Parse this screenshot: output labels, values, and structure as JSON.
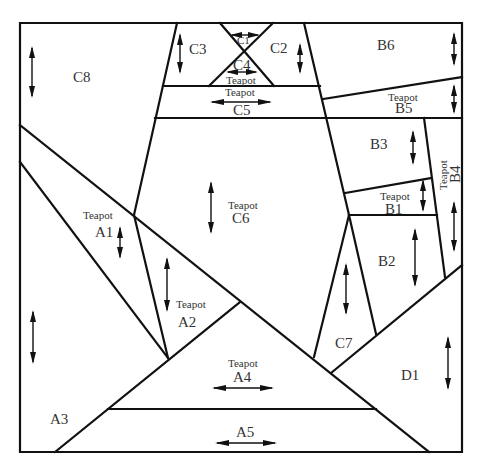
{
  "diagram": {
    "type": "cutting-layout",
    "panel_count": 21,
    "border": {
      "x": 20,
      "y": 23,
      "width": 201,
      "height": 199
    },
    "pieces": [
      {
        "id": "C8",
        "label": "C8",
        "teapot": false,
        "grain": "vertical"
      },
      {
        "id": "C3",
        "label": "C3",
        "teapot": false,
        "grain": "vertical"
      },
      {
        "id": "C1",
        "label": "C1",
        "teapot": false,
        "grain": "horizontal"
      },
      {
        "id": "C2",
        "label": "C2",
        "teapot": false,
        "grain": "vertical"
      },
      {
        "id": "C4",
        "label": "C4",
        "teapot": true,
        "grain": "horizontal"
      },
      {
        "id": "C5",
        "label": "C5",
        "teapot": true,
        "grain": "horizontal"
      },
      {
        "id": "C6",
        "label": "C6",
        "teapot": true,
        "grain": "vertical"
      },
      {
        "id": "C7",
        "label": "C7",
        "teapot": false,
        "grain": "vertical"
      },
      {
        "id": "B6",
        "label": "B6",
        "teapot": false,
        "grain": "vertical"
      },
      {
        "id": "B5",
        "label": "B5",
        "teapot": true,
        "grain": "vertical"
      },
      {
        "id": "B3",
        "label": "B3",
        "teapot": false,
        "grain": "vertical"
      },
      {
        "id": "B4",
        "label": "B4",
        "teapot": true,
        "grain": "vertical"
      },
      {
        "id": "B1",
        "label": "B1",
        "teapot": true,
        "grain": "vertical"
      },
      {
        "id": "B2",
        "label": "B2",
        "teapot": false,
        "grain": "vertical"
      },
      {
        "id": "A1",
        "label": "A1",
        "teapot": true,
        "grain": "vertical"
      },
      {
        "id": "A2",
        "label": "A2",
        "teapot": true,
        "grain": "vertical"
      },
      {
        "id": "A3",
        "label": "A3",
        "teapot": false,
        "grain": "vertical"
      },
      {
        "id": "A4",
        "label": "A4",
        "teapot": true,
        "grain": "horizontal"
      },
      {
        "id": "A5",
        "label": "A5",
        "teapot": false,
        "grain": "horizontal"
      },
      {
        "id": "D1",
        "label": "D1",
        "teapot": false,
        "grain": "vertical"
      }
    ],
    "labels": {
      "C8": "C8",
      "C3": "C3",
      "C1": "C1",
      "C2": "C2",
      "C4": "C4",
      "C5": "C5",
      "C6": "C6",
      "C7": "C7",
      "B6": "B6",
      "B5": "B5",
      "B3": "B3",
      "B4": "B4",
      "B1": "B1",
      "B2": "B2",
      "A1": "A1",
      "A2": "A2",
      "A3": "A3",
      "A4": "A4",
      "A5": "A5",
      "D1": "D1",
      "teapot": "Teapot"
    }
  }
}
